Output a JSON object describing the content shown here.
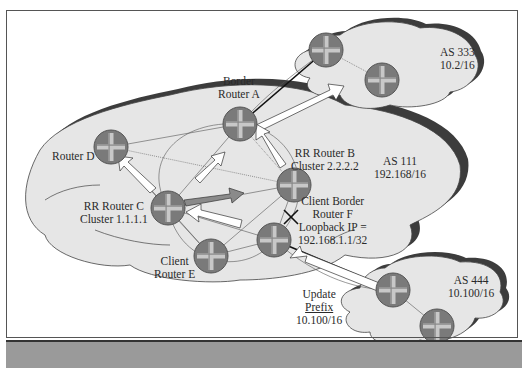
{
  "diagram": {
    "colors": {
      "cloud_fill": "#e6e6e6",
      "cloud_shadow": "#3c3c3c",
      "router_fill": "#7a7a7a",
      "router_cross": "#c8c8c8",
      "arrow_white": "#ffffff",
      "arrow_gray": "#8a8a8a",
      "footer_bar": "#9a9a9a",
      "frame": "#555555"
    },
    "autonomous_systems": [
      {
        "id": "as111",
        "label": "AS 111",
        "prefix": "192.168/16"
      },
      {
        "id": "as333",
        "label": "AS 333",
        "prefix": "10.2/16"
      },
      {
        "id": "as444",
        "label": "AS 444",
        "prefix": "10.100/16"
      }
    ],
    "routers": [
      {
        "id": "A",
        "label_line1": "Border",
        "label_line2": "Router A"
      },
      {
        "id": "B",
        "label_line1": "RR Router B",
        "label_line2": "Cluster 2.2.2.2"
      },
      {
        "id": "C",
        "label_line1": "RR Router C",
        "label_line2": "Cluster 1.1.1.1"
      },
      {
        "id": "D",
        "label_line1": "Router D"
      },
      {
        "id": "E",
        "label_line1": "Client",
        "label_line2": "Router E"
      },
      {
        "id": "F",
        "label_line1": "Client Border",
        "label_line2": "Router F",
        "label_line3": "Loopback IP =",
        "label_line4": "192.168.1.1/32"
      }
    ],
    "update": {
      "line1": "Update",
      "line2": "Prefix",
      "line3": "10.100/16"
    },
    "blocked_link_marker": "X"
  }
}
